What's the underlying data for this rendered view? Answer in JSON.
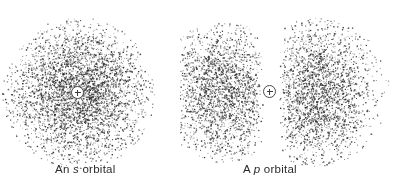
{
  "figure": {
    "background_color": "#ffffff",
    "dot_color": "#2c2c2c",
    "nucleus_color": "#3a3a3a",
    "width": 395,
    "height": 185
  },
  "panels": [
    {
      "id": "s-orbital",
      "caption_prefix": "An ",
      "caption_symbol": "s",
      "caption_suffix": " orbital",
      "caption_full": "An s orbital",
      "nucleus_label": "+",
      "shape": "spherical"
    },
    {
      "id": "p-orbital",
      "caption_prefix": "A ",
      "caption_symbol": "p",
      "caption_suffix": " orbital",
      "caption_full": "A p orbital",
      "nucleus_label": "+",
      "shape": "dumbbell"
    }
  ],
  "chart_data": {
    "type": "scatter",
    "title": "",
    "xlabel": "",
    "ylabel": "",
    "clouds": [
      {
        "name": "s orbital electron cloud",
        "panel": "s-orbital",
        "model": "radial-gaussian",
        "center_x": 78,
        "center_y": 93,
        "sigma_x": 34,
        "sigma_y": 34,
        "max_radius": 76,
        "dot_count": 4200,
        "dot_size_min": 0.6,
        "dot_size_max": 1.5
      },
      {
        "name": "p orbital left lobe",
        "panel": "p-orbital",
        "model": "lobe-gaussian",
        "center_x": 43,
        "center_y": 92,
        "sigma_x": 26,
        "sigma_y": 34,
        "max_radius": 70,
        "dot_count": 2600,
        "dot_size_min": 0.6,
        "dot_size_max": 1.5,
        "nodal_plane_x": 91,
        "node_gap": 8
      },
      {
        "name": "p orbital right lobe",
        "panel": "p-orbital",
        "model": "lobe-gaussian",
        "center_x": 136,
        "center_y": 92,
        "sigma_x": 28,
        "sigma_y": 36,
        "max_radius": 74,
        "dot_count": 2900,
        "dot_size_min": 0.6,
        "dot_size_max": 1.5,
        "nodal_plane_x": 91,
        "node_gap": 8
      }
    ],
    "legend_position": "none",
    "grid": false
  }
}
